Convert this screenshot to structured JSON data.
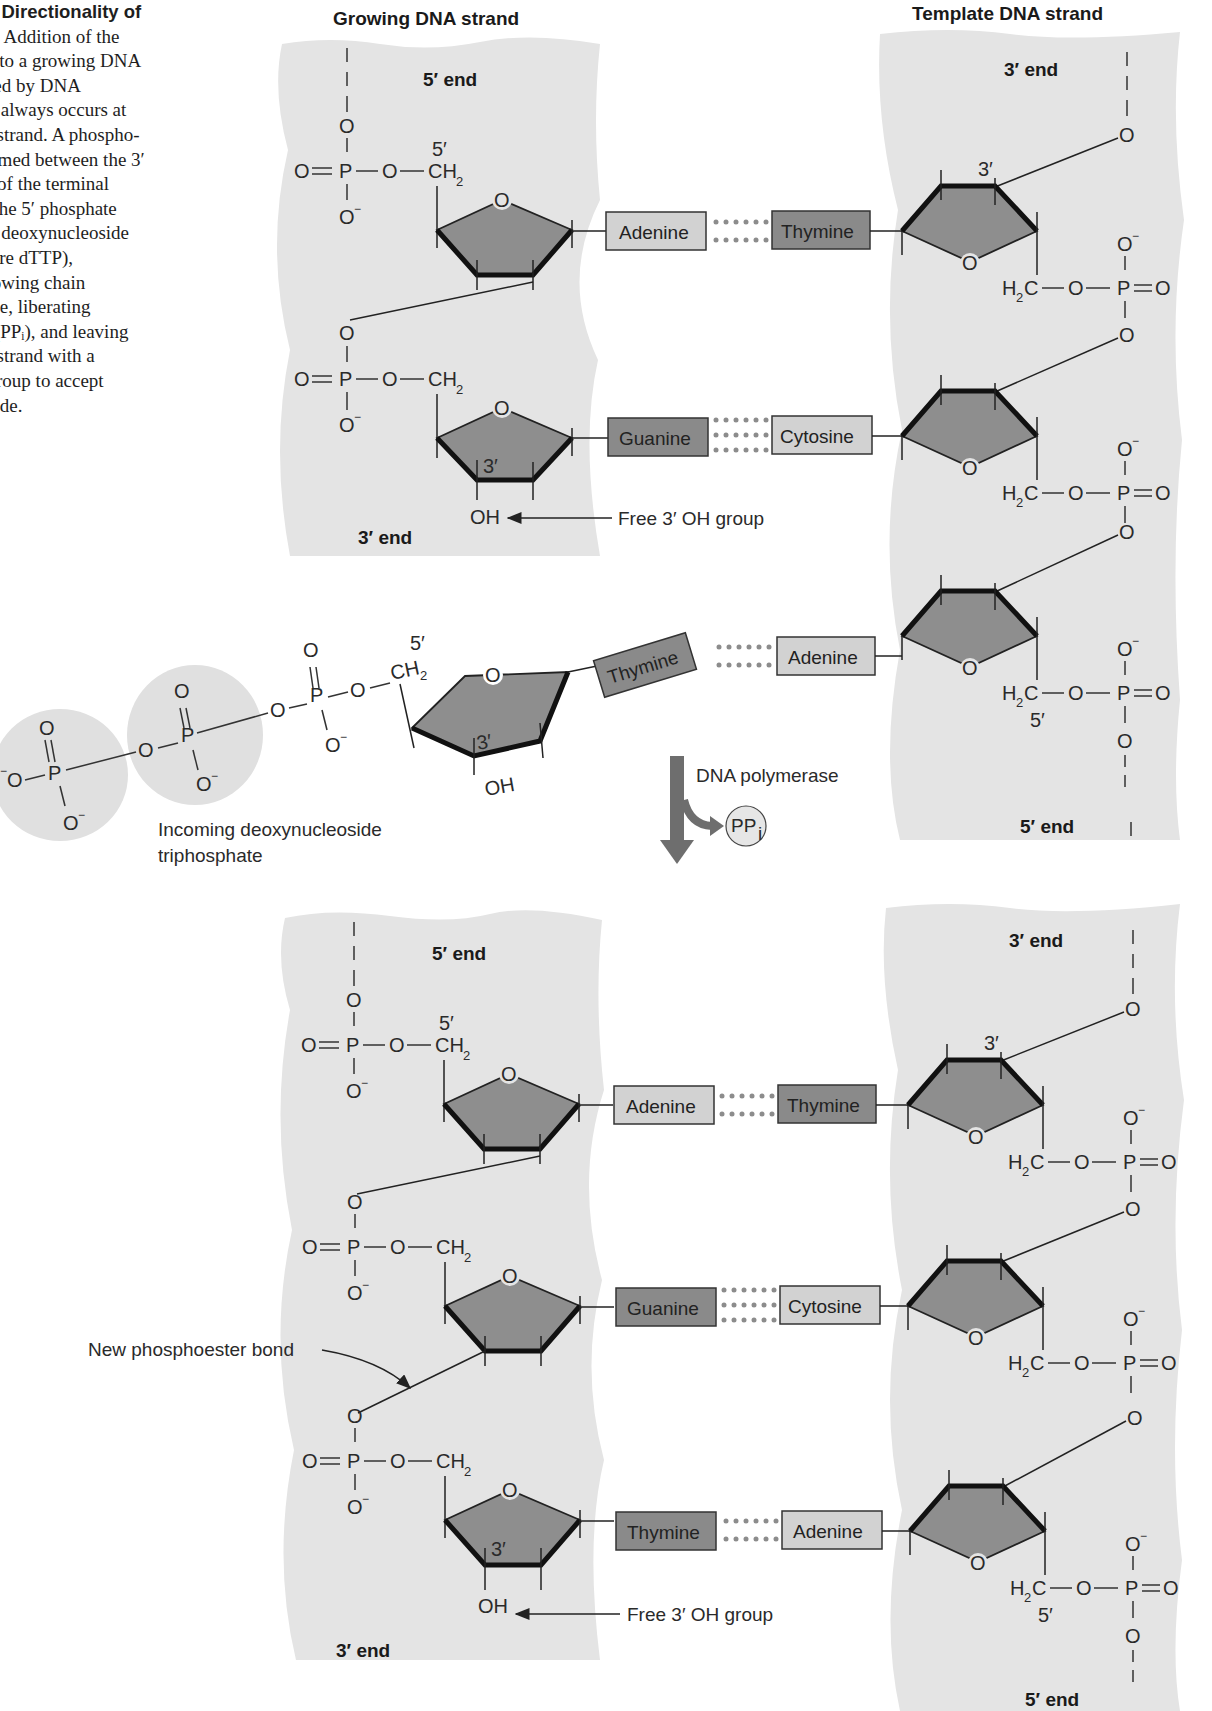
{
  "caption": {
    "title": "7   The Directionality of",
    "title_cont": "esis.",
    "lines": [
      "Addition of the",
      "eotide to a growing DNA",
      "atalyzed by DNA",
      "se and always occurs at",
      " of the strand. A phospho-",
      "l is formed between the 3′",
      "group of the terminal",
      "e and the 5′ phosphate",
      "oming deoxynucleoside",
      "ate (here dTTP),",
      " the growing chain",
      "cleotide, liberating",
      "phate (PPᵢ), and leaving",
      " of the strand with a",
      "oxyl group to accept",
      "ucleotide."
    ]
  },
  "headers": {
    "growing": "Growing DNA strand",
    "template": "Template DNA strand"
  },
  "ends": {
    "five": "5′ end",
    "three": "3′ end"
  },
  "chem": {
    "O": "O",
    "P": "P",
    "Ominus": "O",
    "minus": "−",
    "CH": "CH",
    "sub2": "2",
    "H": "H",
    "C": "C",
    "OH": "OH",
    "prime5": "5′",
    "prime3": "3′",
    "dash": "—",
    "dbl": "="
  },
  "bases": {
    "top": [
      {
        "left": "Adenine",
        "right": "Thymine"
      },
      {
        "left": "Guanine",
        "right": "Cytosine"
      }
    ],
    "incoming": {
      "left": "Thymine",
      "right": "Adenine"
    },
    "bottom": [
      {
        "left": "Adenine",
        "right": "Thymine"
      },
      {
        "left": "Guanine",
        "right": "Cytosine"
      },
      {
        "left": "Thymine",
        "right": "Adenine"
      }
    ]
  },
  "labels": {
    "free_oh": "Free 3′ OH group",
    "incoming_line1": "Incoming deoxynucleoside",
    "incoming_line2": "triphosphate",
    "enzyme": "DNA polymerase",
    "ppi": "PP",
    "ppi_sub": "i",
    "new_bond": "New phosphoester bond"
  },
  "colors": {
    "strand_bg": "#e4e4e4",
    "sugar_fill": "#8e8e8e",
    "base_light": "#d2d2d2",
    "base_dark": "#8a8a8a",
    "hbond_dots": "#8c8c8c",
    "arrow": "#6e6e6e",
    "phosphate_circle": "#e0e0e0"
  }
}
